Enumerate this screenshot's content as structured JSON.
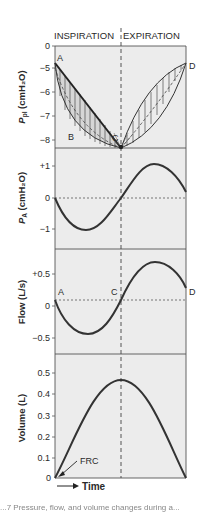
{
  "header": {
    "left_phase": "INSPIRATION",
    "right_phase": "EXPIRATION"
  },
  "panels": [
    {
      "id": "ppl",
      "ylabel_main": "P",
      "ylabel_sub": "pl",
      "ylabel_unit": " (cmH₂O)",
      "ticks": [
        "0",
        "−5",
        "−6",
        "−7",
        "−8"
      ],
      "points": {
        "A": "A",
        "B": "B",
        "C": "C",
        "D": "D"
      }
    },
    {
      "id": "pa",
      "ylabel_main": "P",
      "ylabel_sub": "A",
      "ylabel_unit": " (cmH₂O)",
      "ticks": [
        "+1",
        "0",
        "−1"
      ]
    },
    {
      "id": "flow",
      "ylabel": "Flow (L/s)",
      "ticks": [
        "+0.5",
        "0",
        "−0.5"
      ],
      "points": {
        "A": "A",
        "C": "C",
        "D": "D"
      }
    },
    {
      "id": "volume",
      "ylabel": "Volume (L)",
      "ticks": [
        "0.5",
        "0.4",
        "0.3",
        "0.2",
        "0.1",
        "0"
      ],
      "annotation": "FRC"
    }
  ],
  "xaxis": {
    "label": "Time"
  },
  "caption": "...7  Pressure, flow, and volume changes during a..."
}
